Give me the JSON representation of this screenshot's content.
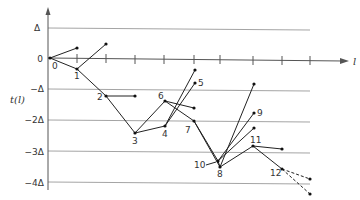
{
  "diagram": {
    "y_axis_label": "t(l)",
    "x_axis_label": "l",
    "y_tick_labels": [
      "Δ",
      "0",
      "−Δ",
      "−2Δ",
      "−3Δ",
      "−4Δ"
    ],
    "node_labels": {
      "n0": "0",
      "n1": "1",
      "n2": "2",
      "n3": "3",
      "n4": "4",
      "n5": "5",
      "n6": "6",
      "n7": "7",
      "n8": "8",
      "n9": "9",
      "n10": "10",
      "n11": "11",
      "n12": "12"
    },
    "colors": {
      "line": "#222222",
      "grid": "#9a9a9a",
      "text": "#333333"
    }
  }
}
